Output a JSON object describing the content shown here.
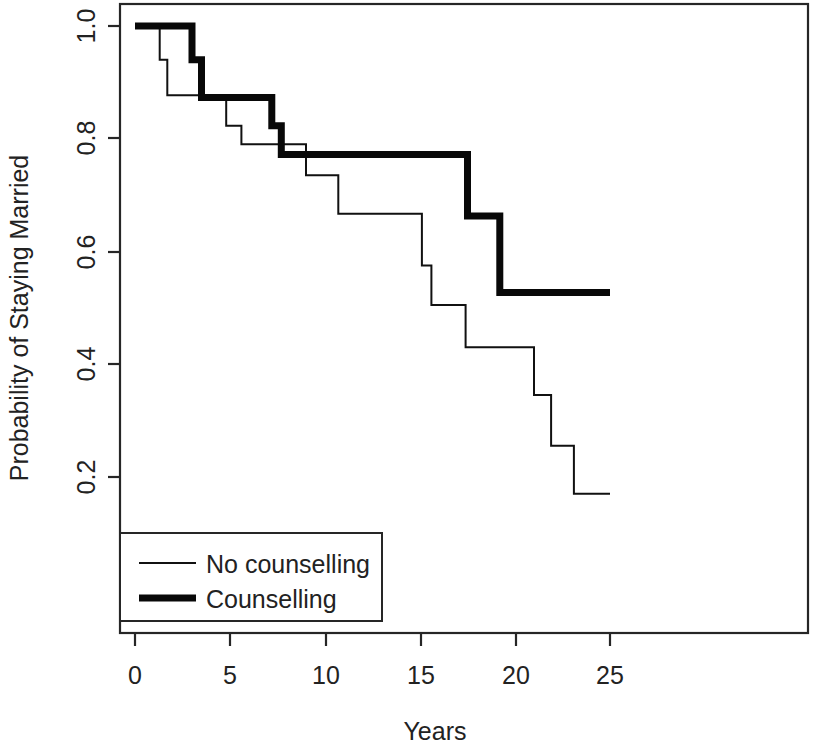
{
  "chart_data": {
    "type": "line",
    "subtype": "kaplan-meier-step",
    "title": "",
    "xlabel": "Years",
    "ylabel": "Probability of Staying Married",
    "xlim": [
      0,
      25
    ],
    "ylim": [
      0.155,
      1.04
    ],
    "grid": false,
    "xticks": [
      0,
      5,
      10,
      15,
      20,
      25
    ],
    "xtick_labels": [
      "0",
      "5",
      "10",
      "15",
      "20",
      "25"
    ],
    "yticks": [
      0.2,
      0.4,
      0.6,
      0.8,
      1.0
    ],
    "ytick_labels": [
      "0.2",
      "0.4",
      "0.6",
      "0.8",
      "1.0"
    ],
    "legend_position": "bottom-left",
    "series": [
      {
        "name": "No counselling",
        "line_style": "thin",
        "color": "#111111",
        "steps_x": [
          0.0,
          1.3,
          1.3,
          1.7,
          1.7,
          4.8,
          4.8,
          5.6,
          5.6,
          9.0,
          9.0,
          10.7,
          10.7,
          15.1,
          15.1,
          15.6,
          15.6,
          17.4,
          17.4,
          21.0,
          21.0,
          21.9,
          21.9,
          23.1,
          23.1,
          25.0
        ],
        "steps_y": [
          1.0,
          1.0,
          0.94,
          0.94,
          0.877,
          0.877,
          0.823,
          0.823,
          0.79,
          0.79,
          0.735,
          0.735,
          0.667,
          0.667,
          0.575,
          0.575,
          0.505,
          0.505,
          0.43,
          0.43,
          0.345,
          0.345,
          0.255,
          0.255,
          0.17,
          0.17
        ],
        "points": [
          {
            "year": 0.0,
            "prob": 1.0
          },
          {
            "year": 1.3,
            "prob": 0.94
          },
          {
            "year": 1.7,
            "prob": 0.877
          },
          {
            "year": 4.8,
            "prob": 0.823
          },
          {
            "year": 5.6,
            "prob": 0.79
          },
          {
            "year": 9.0,
            "prob": 0.735
          },
          {
            "year": 10.7,
            "prob": 0.667
          },
          {
            "year": 15.1,
            "prob": 0.575
          },
          {
            "year": 15.6,
            "prob": 0.505
          },
          {
            "year": 17.4,
            "prob": 0.43
          },
          {
            "year": 21.0,
            "prob": 0.345
          },
          {
            "year": 21.9,
            "prob": 0.255
          },
          {
            "year": 23.1,
            "prob": 0.17
          },
          {
            "year": 25.0,
            "prob": 0.17
          }
        ]
      },
      {
        "name": "Counselling",
        "line_style": "thick",
        "color": "#080808",
        "steps_x": [
          0.0,
          3.0,
          3.0,
          3.5,
          3.5,
          7.2,
          7.2,
          7.7,
          7.7,
          17.5,
          17.5,
          19.2,
          19.2,
          25.0
        ],
        "steps_y": [
          1.0,
          1.0,
          0.94,
          0.94,
          0.873,
          0.873,
          0.823,
          0.823,
          0.772,
          0.772,
          0.663,
          0.663,
          0.527,
          0.527
        ],
        "points": [
          {
            "year": 0.0,
            "prob": 1.0
          },
          {
            "year": 3.0,
            "prob": 0.94
          },
          {
            "year": 3.5,
            "prob": 0.873
          },
          {
            "year": 7.2,
            "prob": 0.823
          },
          {
            "year": 7.7,
            "prob": 0.772
          },
          {
            "year": 17.5,
            "prob": 0.663
          },
          {
            "year": 19.2,
            "prob": 0.527
          },
          {
            "year": 25.0,
            "prob": 0.527
          }
        ]
      }
    ],
    "legend_entries": [
      "No counselling",
      "Counselling"
    ]
  },
  "axes": {
    "x_title": "Years",
    "y_title": "Probability of Staying Married",
    "x_ticks": [
      "0",
      "5",
      "10",
      "15",
      "20",
      "25"
    ],
    "y_ticks": [
      "1.0",
      "0.8",
      "0.6",
      "0.4",
      "0.2"
    ]
  },
  "legend": {
    "entries": [
      {
        "label": "No counselling",
        "style": "thin"
      },
      {
        "label": "Counselling",
        "style": "thick"
      }
    ]
  },
  "colors": {
    "background": "#ffffff",
    "axis": "#262626",
    "thin_line": "#111111",
    "thick_line": "#080808",
    "text": "#222222"
  }
}
